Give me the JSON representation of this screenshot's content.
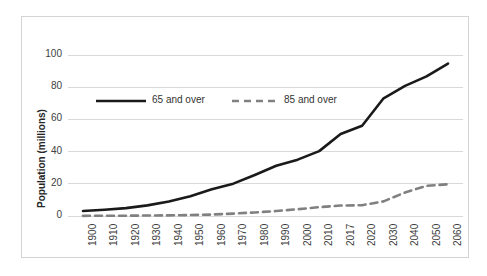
{
  "chart_data": {
    "type": "line",
    "title": "",
    "xlabel": "",
    "ylabel": "Population (millions)",
    "categories": [
      "1900",
      "1910",
      "1920",
      "1930",
      "1940",
      "1950",
      "1960",
      "1970",
      "1980",
      "1990",
      "2000",
      "2010",
      "2017",
      "2020",
      "2030",
      "2040",
      "2050",
      "2060"
    ],
    "ylim": [
      0,
      100
    ],
    "yticks": [
      "0",
      "20",
      "40",
      "60",
      "80",
      "100"
    ],
    "grid": true,
    "legend_position": "inside-upper-left",
    "series": [
      {
        "name": "65 and over",
        "style": "solid",
        "color": "#1a1a1a",
        "values": [
          3.1,
          3.9,
          4.9,
          6.6,
          9.0,
          12.3,
          16.6,
          20.1,
          25.5,
          31.2,
          35.0,
          40.3,
          50.9,
          56.1,
          73.1,
          80.8,
          86.7,
          94.7
        ]
      },
      {
        "name": "85 and over",
        "style": "dashed",
        "color": "#808080",
        "values": [
          0.1,
          0.2,
          0.2,
          0.3,
          0.4,
          0.6,
          0.9,
          1.5,
          2.2,
          3.1,
          4.2,
          5.5,
          6.5,
          6.7,
          9.1,
          14.6,
          18.7,
          19.7
        ]
      }
    ]
  },
  "legend": {
    "items": [
      {
        "label": "65 and over"
      },
      {
        "label": "85 and over"
      }
    ]
  }
}
